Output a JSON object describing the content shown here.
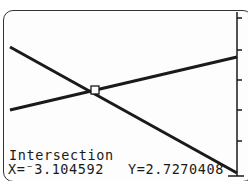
{
  "screen": {
    "mode": "graph",
    "function_label": "Intersection",
    "x_readout": "X=⁻3.104592",
    "y_readout": "Y=2.7270408"
  },
  "graph": {
    "lines": [
      {
        "name": "line-decreasing",
        "from": [
          10,
          47
        ],
        "to": [
          237,
          173
        ]
      },
      {
        "name": "line-increasing",
        "from": [
          10,
          110
        ],
        "to": [
          237,
          57
        ]
      }
    ],
    "intersection_point": {
      "x": -3.104592,
      "y": 2.7270408,
      "pixel": [
        95,
        90
      ]
    },
    "y_axis": {
      "pixel_x": 237,
      "tick_pixels_y": [
        17,
        50,
        80,
        110,
        141,
        175
      ]
    },
    "colors": {
      "ink": "#1a1a1a",
      "background": "#fdfdfd"
    }
  }
}
